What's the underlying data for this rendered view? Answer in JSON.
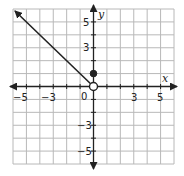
{
  "chart_data": {
    "type": "line",
    "title": "",
    "xlabel": "x",
    "ylabel": "y",
    "xlim": [
      -6,
      6
    ],
    "ylim": [
      -6,
      6
    ],
    "grid": true,
    "x_tick_labels": [
      "-5",
      "-3",
      "0",
      "3",
      "5"
    ],
    "x_tick_values": [
      -5,
      -3,
      0,
      3,
      5
    ],
    "y_tick_labels": [
      "5",
      "3",
      "-3",
      "-5"
    ],
    "y_tick_values": [
      5,
      3,
      -3,
      -5
    ],
    "series": [
      {
        "name": "ray",
        "kind": "ray",
        "start": {
          "x": 0,
          "y": 0,
          "endpoint": "open"
        },
        "through": {
          "x": -6,
          "y": 6
        },
        "arrow": "end"
      },
      {
        "name": "point",
        "kind": "point",
        "x": 0,
        "y": 1,
        "endpoint": "closed"
      }
    ],
    "colors": {
      "grid": "#b8b8b8",
      "axis": "#222222",
      "line": "#222222"
    }
  },
  "labels": {
    "x_axis": "x",
    "y_axis": "y",
    "origin": "0",
    "x_ticks": [
      "−5",
      "−3",
      "3",
      "5"
    ],
    "y_ticks": [
      "5",
      "3",
      "−3",
      "−5"
    ]
  }
}
